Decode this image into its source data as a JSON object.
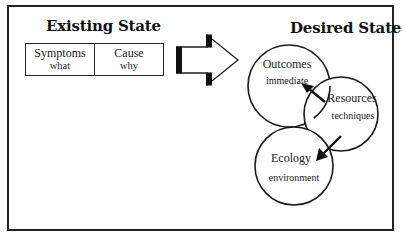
{
  "existing_state": {
    "title": "Existing State",
    "columns": [
      {
        "label": "Symptoms",
        "sublabel": "what"
      },
      {
        "label": "Cause",
        "sublabel": "why"
      }
    ]
  },
  "transition_arrow": {
    "icon": "block-arrow-right-icon",
    "direction": "right"
  },
  "desired_state": {
    "title": "Desired State",
    "circles": [
      {
        "label": "Outcomes",
        "sublabel": "immediate"
      },
      {
        "label": "Resources",
        "sublabel": "techniques"
      },
      {
        "label": "Ecology",
        "sublabel": "environment"
      }
    ],
    "arrows": [
      {
        "from": "Resources",
        "to": "Outcomes",
        "icon": "arrow-up-left-icon"
      },
      {
        "from": "Resources",
        "to": "Ecology",
        "icon": "arrow-down-left-icon"
      }
    ]
  },
  "colors": {
    "stroke": "#222222",
    "background": "#ffffff",
    "text": "#111111"
  }
}
